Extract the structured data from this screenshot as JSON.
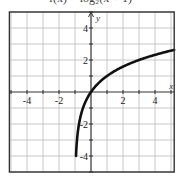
{
  "chart_data": {
    "type": "line",
    "title": "f(x) = log₂(x + 1)",
    "xlabel": "x",
    "ylabel": "y",
    "xlim": [
      -5.1,
      5.2
    ],
    "ylim": [
      -5,
      5
    ],
    "grid": true,
    "grid_step": 1,
    "x_tick_labels": [
      "-4",
      "-2",
      "2",
      "4"
    ],
    "x_ticks": [
      -4,
      -2,
      2,
      4
    ],
    "y_tick_labels": [
      "4",
      "2",
      "-2",
      "-4"
    ],
    "y_ticks": [
      4,
      2,
      -2,
      -4
    ],
    "series": [
      {
        "name": "y = log2(x + 1)",
        "x": [
          -0.9375,
          -0.875,
          -0.75,
          -0.5,
          0,
          1,
          2,
          3,
          4,
          5,
          5.2
        ],
        "y": [
          -4,
          -3,
          -2,
          -1,
          0,
          1,
          1.585,
          2,
          2.32,
          2.585,
          2.63
        ]
      }
    ],
    "colors": {
      "grid": "#c8c8c8",
      "frame": "#333333",
      "curve": "#111111"
    }
  }
}
